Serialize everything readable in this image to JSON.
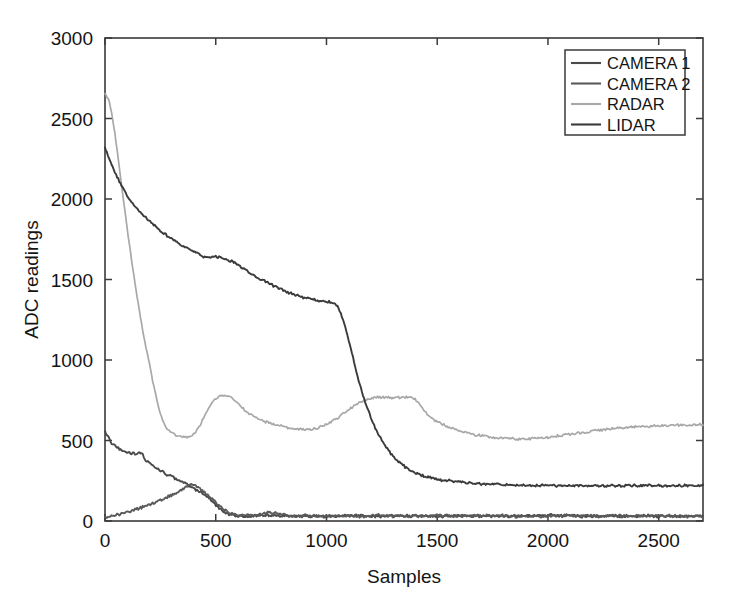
{
  "chart_data": {
    "type": "line",
    "title": "",
    "subtitle": "",
    "xlabel": "Samples",
    "ylabel": "ADC readings",
    "xlim": [
      0,
      2700
    ],
    "ylim": [
      0,
      3000
    ],
    "xticks": [
      0,
      500,
      1000,
      1500,
      2000,
      2500
    ],
    "yticks": [
      0,
      500,
      1000,
      1500,
      2000,
      2500,
      3000
    ],
    "xticklabels": [
      "0",
      "500",
      "1000",
      "1500",
      "2000",
      "2500"
    ],
    "yticklabels": [
      "0",
      "500",
      "1000",
      "1500",
      "2000",
      "2500",
      "3000"
    ],
    "grid": false,
    "legend_position": "upper right",
    "background": "#ffffff",
    "axis_color": "#3a3a3a",
    "series": [
      {
        "name": "CAMERA 1",
        "color": "#4a4a4a",
        "x": [
          0,
          20,
          40,
          60,
          80,
          100,
          120,
          140,
          155,
          165,
          175,
          185,
          200,
          230,
          260,
          290,
          320,
          350,
          380,
          410,
          440,
          470,
          500,
          530,
          560,
          600,
          650,
          700,
          760,
          820,
          880,
          950,
          1030,
          1120,
          1220,
          1330,
          1450,
          1580,
          1720,
          1870,
          2030,
          2200,
          2380,
          2560,
          2700
        ],
        "y": [
          560,
          505,
          470,
          450,
          437,
          428,
          423,
          420,
          422,
          425,
          398,
          378,
          358,
          330,
          305,
          283,
          262,
          240,
          218,
          196,
          172,
          140,
          100,
          62,
          40,
          32,
          30,
          34,
          36,
          30,
          33,
          29,
          31,
          34,
          30,
          32,
          29,
          33,
          30,
          31,
          34,
          29,
          32,
          30,
          31
        ]
      },
      {
        "name": "CAMERA 2",
        "color": "#5a5a5a",
        "x": [
          0,
          30,
          60,
          100,
          140,
          180,
          220,
          260,
          300,
          330,
          355,
          375,
          390,
          405,
          420,
          440,
          465,
          490,
          515,
          540,
          565,
          600,
          650,
          700,
          740,
          790,
          840,
          900,
          970,
          1050,
          1140,
          1240,
          1350,
          1470,
          1600,
          1750,
          1910,
          2080,
          2260,
          2450,
          2640,
          2700
        ],
        "y": [
          22,
          30,
          40,
          55,
          72,
          92,
          113,
          135,
          160,
          180,
          200,
          218,
          228,
          225,
          212,
          190,
          160,
          128,
          96,
          68,
          48,
          38,
          35,
          40,
          52,
          44,
          30,
          34,
          29,
          33,
          30,
          35,
          29,
          32,
          30,
          34,
          28,
          33,
          30,
          32,
          29,
          31
        ]
      },
      {
        "name": "RADAR",
        "color": "#a8a8a8",
        "x": [
          0,
          15,
          30,
          45,
          60,
          80,
          100,
          125,
          150,
          175,
          200,
          220,
          240,
          260,
          280,
          310,
          340,
          370,
          400,
          430,
          460,
          490,
          520,
          545,
          570,
          600,
          630,
          665,
          700,
          740,
          780,
          820,
          860,
          900,
          950,
          1000,
          1050,
          1100,
          1150,
          1200,
          1250,
          1290,
          1330,
          1370,
          1400,
          1425,
          1450,
          1490,
          1540,
          1600,
          1660,
          1720,
          1790,
          1860,
          1930,
          2000,
          2080,
          2170,
          2270,
          2380,
          2490,
          2600,
          2700
        ],
        "y": [
          2650,
          2620,
          2530,
          2400,
          2250,
          2030,
          1820,
          1570,
          1350,
          1150,
          980,
          840,
          720,
          630,
          575,
          540,
          525,
          520,
          540,
          600,
          680,
          745,
          775,
          780,
          765,
          730,
          690,
          655,
          630,
          610,
          595,
          582,
          572,
          568,
          575,
          600,
          640,
          690,
          735,
          762,
          770,
          765,
          768,
          770,
          755,
          715,
          670,
          625,
          590,
          560,
          540,
          525,
          515,
          510,
          512,
          520,
          535,
          552,
          570,
          582,
          590,
          596,
          600
        ]
      },
      {
        "name": "LIDAR",
        "color": "#3b3b3b",
        "x": [
          0,
          25,
          50,
          80,
          110,
          145,
          180,
          220,
          265,
          310,
          360,
          410,
          460,
          510,
          560,
          590,
          610,
          640,
          680,
          720,
          760,
          810,
          860,
          910,
          960,
          1000,
          1025,
          1040,
          1055,
          1075,
          1095,
          1115,
          1140,
          1165,
          1190,
          1220,
          1250,
          1285,
          1320,
          1360,
          1400,
          1450,
          1510,
          1580,
          1660,
          1750,
          1850,
          1960,
          2080,
          2210,
          2350,
          2500,
          2650,
          2700
        ],
        "y": [
          2320,
          2230,
          2150,
          2070,
          2000,
          1940,
          1890,
          1840,
          1790,
          1745,
          1700,
          1665,
          1635,
          1640,
          1620,
          1605,
          1580,
          1555,
          1520,
          1490,
          1462,
          1430,
          1405,
          1385,
          1370,
          1362,
          1358,
          1350,
          1320,
          1250,
          1150,
          1040,
          900,
          780,
          680,
          580,
          500,
          430,
          378,
          330,
          300,
          275,
          258,
          245,
          235,
          228,
          224,
          221,
          220,
          219,
          220,
          220,
          219,
          220
        ]
      }
    ]
  },
  "legend": {
    "entries": [
      {
        "label": "CAMERA 1",
        "color": "#4a4a4a"
      },
      {
        "label": "CAMERA 2",
        "color": "#5a5a5a"
      },
      {
        "label": "RADAR",
        "color": "#a8a8a8"
      },
      {
        "label": "LIDAR",
        "color": "#3b3b3b"
      }
    ]
  }
}
